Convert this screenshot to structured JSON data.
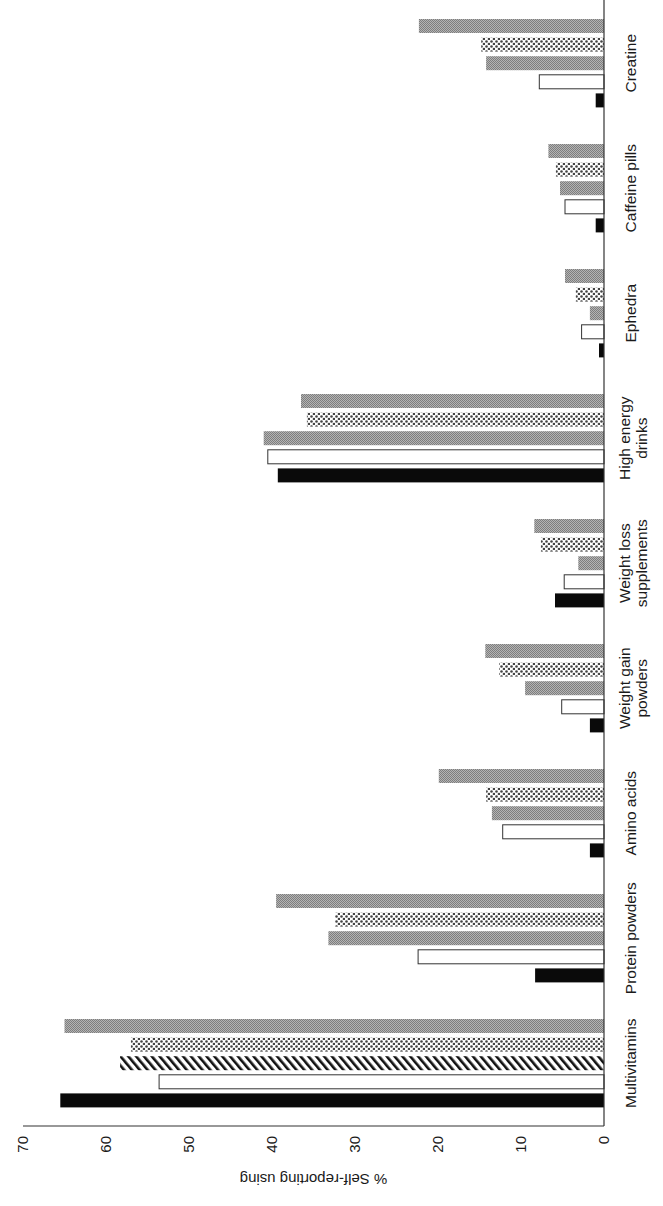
{
  "chart_data": {
    "type": "bar",
    "orientation": "rotated-90-ccw (categories along right edge, values grow leftward)",
    "title": "",
    "xlabel": "",
    "ylabel": "% Self-reporting using",
    "ylim": [
      0,
      70
    ],
    "yticks": [
      0,
      10,
      20,
      30,
      40,
      50,
      60,
      70
    ],
    "grid": false,
    "legend": null,
    "categories": [
      "Multivitamins",
      "Protein powders",
      "Amino acids",
      "Weight gain powders",
      "Weight loss supplements",
      "High energy drinks",
      "Ephedra",
      "Caffeine pills",
      "Creatine"
    ],
    "category_label_lines": [
      [
        "Multivitamins"
      ],
      [
        "Protein powders"
      ],
      [
        "Amino acids"
      ],
      [
        "Weight gain",
        "powders"
      ],
      [
        "Weight loss",
        "supplements"
      ],
      [
        "High energy",
        "drinks"
      ],
      [
        "Ephedra"
      ],
      [
        "Caffeine pills"
      ],
      [
        "Creatine"
      ]
    ],
    "series": [
      {
        "name": "Series 1 (black)",
        "fill": "black",
        "values": [
          65.5,
          8.3,
          1.7,
          1.7,
          5.9,
          39.3,
          0.6,
          1.0,
          1.0
        ]
      },
      {
        "name": "Series 2 (white)",
        "fill": "white",
        "values": [
          53.6,
          22.4,
          12.2,
          5.1,
          4.8,
          40.5,
          2.7,
          4.7,
          7.8
        ]
      },
      {
        "name": "Series 3 (diagonal hatch / gray)",
        "fill": "hatch-or-gray",
        "values": [
          58.3,
          33.2,
          13.5,
          9.5,
          3.1,
          41.0,
          1.7,
          5.3,
          14.2
        ]
      },
      {
        "name": "Series 4 (dotted)",
        "fill": "dots",
        "values": [
          57.0,
          32.4,
          14.2,
          12.6,
          7.6,
          35.8,
          3.4,
          5.8,
          14.8
        ]
      },
      {
        "name": "Series 5 (fine gray)",
        "fill": "gray",
        "values": [
          65.0,
          39.5,
          19.9,
          14.3,
          8.4,
          36.5,
          4.7,
          6.7,
          22.3
        ]
      }
    ],
    "series3_hatched_categories": [
      "Multivitamins"
    ]
  },
  "colors": {
    "axis": "#333333",
    "black_bar": "#0a0a0a",
    "white_bar": "#ffffff",
    "gray_bar": "#9a9a9a",
    "dot_fill": "#555555",
    "text": "#1a1a1a"
  }
}
